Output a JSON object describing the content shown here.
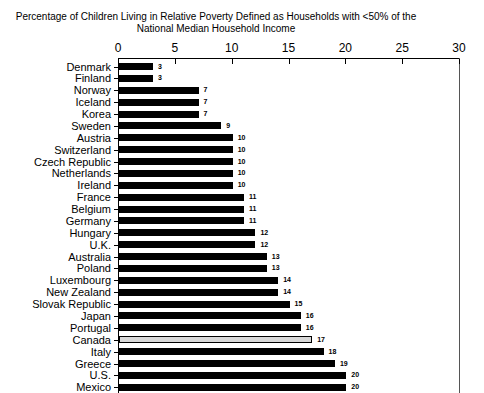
{
  "title": {
    "line1": "Percentage of Children Living in Relative Poverty Defined as Households with <50% of the",
    "line2": "National Median Household Income"
  },
  "chart_data": {
    "type": "bar",
    "orientation": "horizontal",
    "title": "Percentage of Children Living in Relative Poverty Defined as Households with <50% of the National Median Household Income",
    "xlabel": "",
    "ylabel": "",
    "xlim": [
      0,
      30
    ],
    "axis_ticks": [
      0,
      5,
      10,
      15,
      20,
      25,
      30
    ],
    "axis_position": "top",
    "grid": false,
    "legend": false,
    "value_labels_shown": true,
    "bar_color": "#000000",
    "highlighted_category": "Canada",
    "highlight_fill": "#d8d8d8",
    "highlight_border": "#000000",
    "categories": [
      "Denmark",
      "Finland",
      "Norway",
      "Iceland",
      "Korea",
      "Sweden",
      "Austria",
      "Switzerland",
      "Czech Republic",
      "Netherlands",
      "Ireland",
      "France",
      "Belgium",
      "Germany",
      "Hungary",
      "U.K.",
      "Australia",
      "Poland",
      "Luxembourg",
      "New Zealand",
      "Slovak Republic",
      "Japan",
      "Portugal",
      "Canada",
      "Italy",
      "Greece",
      "U.S.",
      "Mexico"
    ],
    "values": [
      3,
      3,
      7,
      7,
      7,
      9,
      10,
      10,
      10,
      10,
      10,
      11,
      11,
      11,
      12,
      12,
      13,
      13,
      14,
      14,
      15,
      16,
      16,
      17,
      18,
      19,
      20,
      20
    ]
  }
}
